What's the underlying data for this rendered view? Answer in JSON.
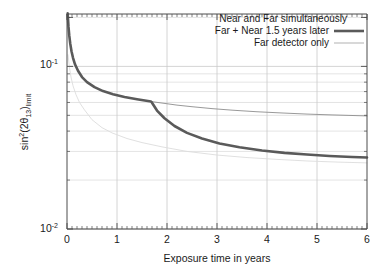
{
  "chart_data": {
    "type": "line",
    "title": "",
    "xlabel": "Exposure time in years",
    "ylabel": "sin^2(2theta_13)_limit",
    "ylabel_parts": {
      "sin": "sin",
      "exp": "2",
      "open": "(2",
      "theta": "θ",
      "theta_sub": "13",
      "close": ")",
      "limit_sub": "limit"
    },
    "xlim": [
      0,
      6
    ],
    "ylim": [
      0.01,
      0.21
    ],
    "yscale": "log",
    "xscale": "linear",
    "grid": true,
    "grid_style": "light-gray horizontal log-minor lines and vertical integer lines",
    "xticks": [
      0,
      1,
      2,
      3,
      4,
      5,
      6
    ],
    "xtick_labels": [
      "0",
      "1",
      "2",
      "3",
      "4",
      "5",
      "6"
    ],
    "yticks": [
      0.01,
      0.1
    ],
    "ytick_labels": [
      "10-2",
      "10-1"
    ],
    "ytick_label_mantissa": "10",
    "ytick_label_exponents": [
      "-2",
      "-1"
    ],
    "legend_position": "top-right",
    "series": [
      {
        "name": "Near and Far simultaneously",
        "style": "very-faint-thin",
        "color": "#dcdcdc",
        "x": [
          0.02,
          0.05,
          0.08,
          0.12,
          0.18,
          0.25,
          0.35,
          0.5,
          0.7,
          0.9,
          1.2,
          1.5,
          1.9,
          2.4,
          3.0,
          3.6,
          4.2,
          4.8,
          5.4,
          6.0
        ],
        "y": [
          0.118,
          0.098,
          0.086,
          0.076,
          0.067,
          0.06,
          0.054,
          0.047,
          0.042,
          0.039,
          0.036,
          0.034,
          0.032,
          0.03,
          0.0285,
          0.0275,
          0.0268,
          0.0262,
          0.0258,
          0.0255
        ]
      },
      {
        "name": "Far + Near 1.5 years later",
        "style": "thick",
        "color": "#5a5a5a",
        "x": [
          0.012,
          0.02,
          0.03,
          0.045,
          0.065,
          0.09,
          0.12,
          0.16,
          0.22,
          0.3,
          0.4,
          0.55,
          0.72,
          0.92,
          1.15,
          1.4,
          1.68,
          1.7,
          1.8,
          1.95,
          2.15,
          2.4,
          2.7,
          3.05,
          3.45,
          3.9,
          4.35,
          4.8,
          5.25,
          5.7,
          6.0
        ],
        "y": [
          0.212,
          0.196,
          0.175,
          0.155,
          0.138,
          0.124,
          0.113,
          0.103,
          0.094,
          0.086,
          0.08,
          0.0745,
          0.0705,
          0.0675,
          0.0648,
          0.0628,
          0.0608,
          0.0598,
          0.0535,
          0.048,
          0.043,
          0.039,
          0.036,
          0.0336,
          0.0318,
          0.0304,
          0.0294,
          0.0287,
          0.0281,
          0.0277,
          0.0275
        ]
      },
      {
        "name": "Far detector only",
        "style": "thin",
        "color": "#8d8d8d",
        "x": [
          1.68,
          1.9,
          2.2,
          2.5,
          2.9,
          3.3,
          3.8,
          4.3,
          4.8,
          5.3,
          5.8,
          6.0
        ],
        "y": [
          0.0608,
          0.0595,
          0.0578,
          0.0565,
          0.055,
          0.0538,
          0.0526,
          0.0517,
          0.0509,
          0.0503,
          0.0498,
          0.0496
        ]
      }
    ],
    "annotations": [
      {
        "text": "kink where Near detector data begins",
        "x": 1.7,
        "y": 0.0598
      }
    ]
  },
  "legend": {
    "entries": [
      {
        "label": "Near and Far simultaneously",
        "sample": "none"
      },
      {
        "label": "Far + Near 1.5 years later",
        "sample": "thick-line"
      },
      {
        "label": "Far detector only",
        "sample": "thin-line"
      }
    ]
  },
  "axes": {
    "x_title": "Exposure time in years",
    "x_tick_labels": [
      "0",
      "1",
      "2",
      "3",
      "4",
      "5",
      "6"
    ],
    "y_tick_top_mantissa": "10",
    "y_tick_top_exp": "-1",
    "y_tick_bottom_mantissa": "10",
    "y_tick_bottom_exp": "-2"
  },
  "colors": {
    "background": "#ffffff",
    "axis": "#4d4d4d",
    "grid": "#d9d9d9",
    "thick_curve": "#5a5a5a",
    "thin_curve": "#8d8d8d",
    "faint_curve": "#dcdcdc",
    "text": "#1a1a1a"
  }
}
